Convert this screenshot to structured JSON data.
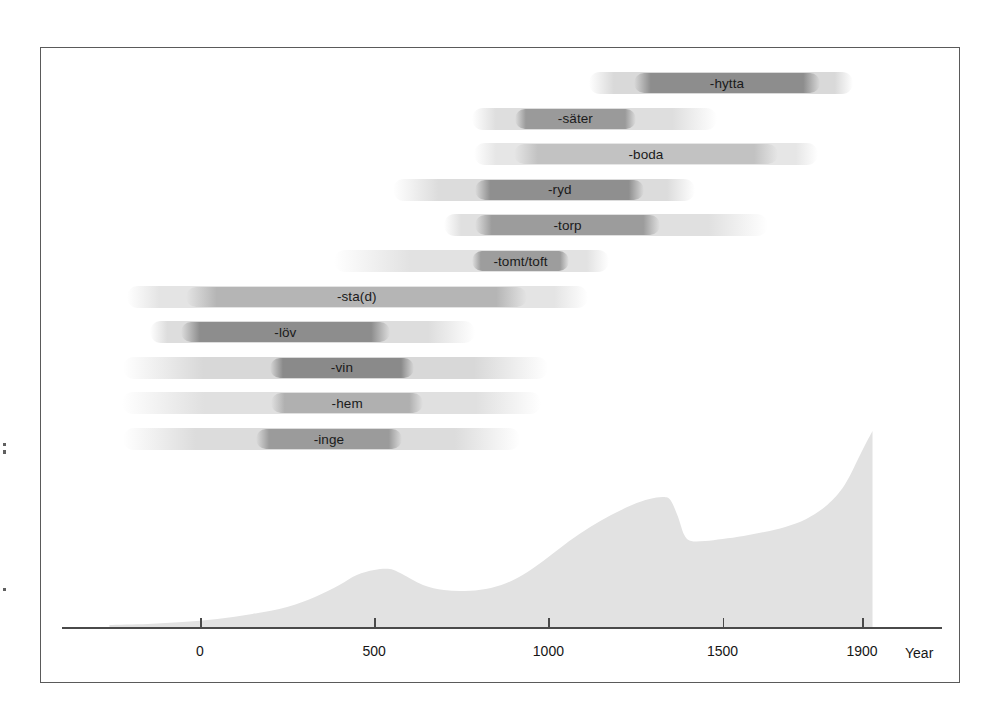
{
  "figure": {
    "background": "#ffffff",
    "frame_color": "#5a5a5a",
    "axis_color": "#4a4a4a",
    "label_color": "#161616"
  },
  "chart_data": {
    "type": "bar",
    "title": "",
    "subtitle": "",
    "xlabel": "Year",
    "ylabel": "",
    "xlim": [
      -250,
      1960
    ],
    "grid": false,
    "legend": null,
    "axis": {
      "tick_values": [
        0,
        500,
        1000,
        1500,
        1900
      ],
      "tick_labels": [
        "0",
        "500",
        "1000",
        "1500",
        "1900"
      ],
      "unit_label": "Year"
    },
    "categories": [
      "-hytta",
      "-säter",
      "-boda",
      "-ryd",
      "-torp",
      "-tomt/toft",
      "-sta(d)",
      "-löv",
      "-vin",
      "-hem",
      "-inge"
    ],
    "bars": [
      {
        "label": "-hytta",
        "fade_start": 1115,
        "core_start": 1245,
        "core_end": 1780,
        "fade_end": 1875,
        "core_shade": "#8d8d8d",
        "edge_shade": "#d9d9d9"
      },
      {
        "label": "-säter",
        "fade_start": 780,
        "core_start": 905,
        "core_end": 1250,
        "fade_end": 1485,
        "core_shade": "#9a9a9a",
        "edge_shade": "#dedede"
      },
      {
        "label": "-boda",
        "fade_start": 785,
        "core_start": 900,
        "core_end": 1660,
        "fade_end": 1775,
        "core_shade": "#c2c2c2",
        "edge_shade": "#e6e6e6"
      },
      {
        "label": "-ryd",
        "fade_start": 555,
        "core_start": 790,
        "core_end": 1275,
        "fade_end": 1420,
        "core_shade": "#8f8f8f",
        "edge_shade": "#dcdcdc"
      },
      {
        "label": "-torp",
        "fade_start": 700,
        "core_start": 790,
        "core_end": 1320,
        "fade_end": 1630,
        "core_shade": "#9c9c9c",
        "edge_shade": "#e0e0e0"
      },
      {
        "label": "-tomt/toft",
        "fade_start": 385,
        "core_start": 780,
        "core_end": 1060,
        "fade_end": 1175,
        "core_shade": "#9d9d9d",
        "edge_shade": "#e2e2e2"
      },
      {
        "label": "-sta(d)",
        "fade_start": -210,
        "core_start": -40,
        "core_end": 940,
        "fade_end": 1115,
        "core_shade": "#b5b5b5",
        "edge_shade": "#e4e4e4"
      },
      {
        "label": "-löv",
        "fade_start": -145,
        "core_start": -55,
        "core_end": 545,
        "fade_end": 790,
        "core_shade": "#8d8d8d",
        "edge_shade": "#dddddd"
      },
      {
        "label": "-vin",
        "fade_start": -220,
        "core_start": 200,
        "core_end": 615,
        "fade_end": 1000,
        "core_shade": "#8a8a8a",
        "edge_shade": "#d8d8d8"
      },
      {
        "label": "-hem",
        "fade_start": -225,
        "core_start": 205,
        "core_end": 640,
        "fade_end": 980,
        "core_shade": "#b0b0b0",
        "edge_shade": "#e0e0e0"
      },
      {
        "label": "-inge",
        "fade_start": -220,
        "core_start": 160,
        "core_end": 580,
        "fade_end": 920,
        "core_shade": "#9b9b9b",
        "edge_shade": "#dcdcdc"
      }
    ],
    "area_curve": {
      "name": "settlement-intensity",
      "fill": "#e2e2e2",
      "x": [
        -260,
        -150,
        -50,
        50,
        150,
        250,
        330,
        400,
        450,
        500,
        545,
        580,
        640,
        700,
        760,
        820,
        880,
        940,
        1000,
        1060,
        1120,
        1180,
        1240,
        1290,
        1330,
        1350,
        1370,
        1390,
        1410,
        1450,
        1500,
        1560,
        1620,
        1680,
        1740,
        1800,
        1850,
        1900,
        1930
      ],
      "y": [
        2,
        3,
        5,
        8,
        13,
        20,
        30,
        42,
        52,
        57,
        58,
        53,
        42,
        37,
        36,
        38,
        44,
        55,
        70,
        86,
        100,
        112,
        122,
        128,
        130,
        127,
        112,
        92,
        86,
        86,
        88,
        91,
        95,
        100,
        108,
        122,
        142,
        176,
        196
      ],
      "ylim": [
        0,
        200
      ]
    }
  }
}
